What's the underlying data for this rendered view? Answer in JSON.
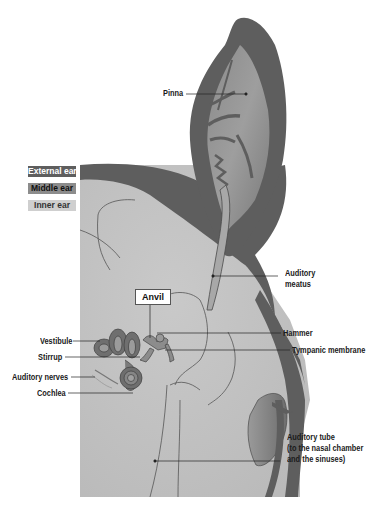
{
  "diagram": {
    "colors": {
      "external_ear": "#5e5e5e",
      "middle_ear": "#8c8c8c",
      "inner_ear": "#c6c6c6",
      "background_panel": "#bdbdbd",
      "label_text": "#1a1a1a"
    }
  },
  "legend": {
    "items": [
      {
        "label": "External ear",
        "bg": "#5e5e5e",
        "fg": "#ffffff"
      },
      {
        "label": "Middle ear",
        "bg": "#8c8c8c",
        "fg": "#111111"
      },
      {
        "label": "Inner ear",
        "bg": "#cfcfcf",
        "fg": "#333333"
      }
    ]
  },
  "labels": {
    "pinna": "Pinna",
    "auditory_meatus_1": "Auditory",
    "auditory_meatus_2": "meatus",
    "anvil": "Anvil",
    "vestibule": "Vestibule",
    "hammer": "Hammer",
    "stirrup": "Stirrup",
    "tympanic_membrane": "Tympanic membrane",
    "auditory_nerves": "Auditory  nerves",
    "cochlea": "Cochlea",
    "auditory_tube_1": "Auditory tube",
    "auditory_tube_2": "(to the nasal chamber",
    "auditory_tube_3": "and the sinuses)"
  }
}
